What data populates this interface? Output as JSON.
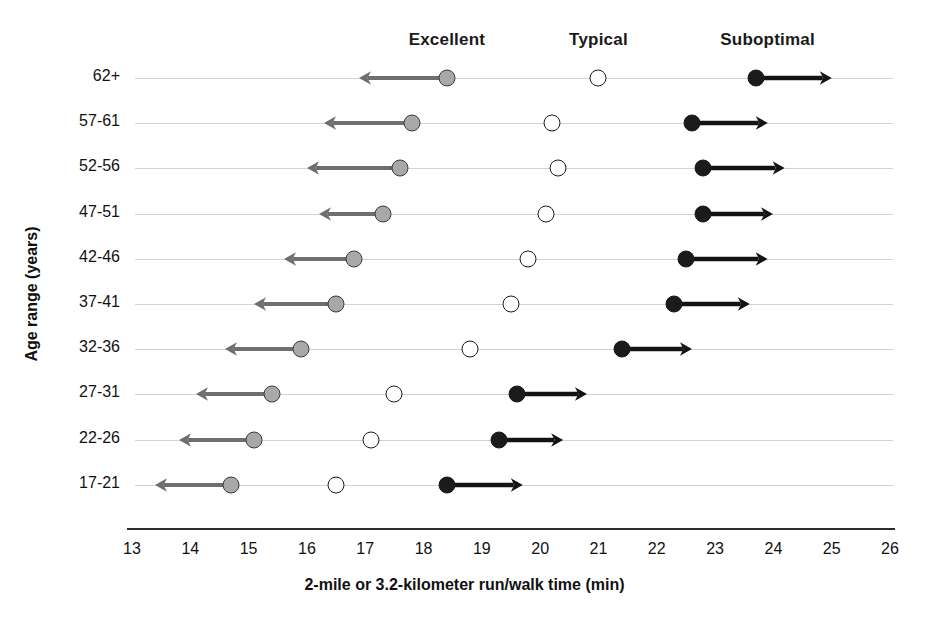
{
  "chart_data": {
    "type": "scatter",
    "title": "",
    "xlabel": "2-mile or 3.2-kilometer run/walk time (min)",
    "ylabel": "Age range (years)",
    "xlim": [
      13,
      26
    ],
    "xticks": [
      13,
      14,
      15,
      16,
      17,
      18,
      19,
      20,
      21,
      22,
      23,
      24,
      25,
      26
    ],
    "grid": true,
    "legend_position": "top",
    "zones": [
      {
        "key": "excellent",
        "label": "Excellent",
        "header_x": 18.4,
        "color": "#a8a8a8",
        "marker": "filled-gray-circle",
        "direction": "left"
      },
      {
        "key": "typical",
        "label": "Typical",
        "header_x": 21.0,
        "color": "#ffffff",
        "marker": "open-circle",
        "direction": "none"
      },
      {
        "key": "suboptimal",
        "label": "Suboptimal",
        "header_x": 23.9,
        "color": "#1b1b1b",
        "marker": "filled-black-circle",
        "direction": "right"
      }
    ],
    "categories": [
      "62+",
      "57-61",
      "52-56",
      "47-51",
      "42-46",
      "37-41",
      "32-36",
      "27-31",
      "22-26",
      "17-21"
    ],
    "rows": [
      {
        "category": "62+",
        "excellent": 18.4,
        "excellent_arrow_to": 16.9,
        "typical": 21.0,
        "suboptimal": 23.7,
        "suboptimal_arrow_to": 25.0
      },
      {
        "category": "57-61",
        "excellent": 17.8,
        "excellent_arrow_to": 16.3,
        "typical": 20.2,
        "suboptimal": 22.6,
        "suboptimal_arrow_to": 23.9
      },
      {
        "category": "52-56",
        "excellent": 17.6,
        "excellent_arrow_to": 16.0,
        "typical": 20.3,
        "suboptimal": 22.8,
        "suboptimal_arrow_to": 24.2
      },
      {
        "category": "47-51",
        "excellent": 17.3,
        "excellent_arrow_to": 16.2,
        "typical": 20.1,
        "suboptimal": 22.8,
        "suboptimal_arrow_to": 24.0
      },
      {
        "category": "42-46",
        "excellent": 16.8,
        "excellent_arrow_to": 15.6,
        "typical": 19.8,
        "suboptimal": 22.5,
        "suboptimal_arrow_to": 23.9
      },
      {
        "category": "37-41",
        "excellent": 16.5,
        "excellent_arrow_to": 15.1,
        "typical": 19.5,
        "suboptimal": 22.3,
        "suboptimal_arrow_to": 23.6
      },
      {
        "category": "32-36",
        "excellent": 15.9,
        "excellent_arrow_to": 14.6,
        "typical": 18.8,
        "suboptimal": 21.4,
        "suboptimal_arrow_to": 22.6
      },
      {
        "category": "27-31",
        "excellent": 15.4,
        "excellent_arrow_to": 14.1,
        "typical": 17.5,
        "suboptimal": 19.6,
        "suboptimal_arrow_to": 20.8
      },
      {
        "category": "22-26",
        "excellent": 15.1,
        "excellent_arrow_to": 13.8,
        "typical": 17.1,
        "suboptimal": 19.3,
        "suboptimal_arrow_to": 20.4
      },
      {
        "category": "17-21",
        "excellent": 14.7,
        "excellent_arrow_to": 13.4,
        "typical": 16.5,
        "suboptimal": 18.4,
        "suboptimal_arrow_to": 19.7
      }
    ]
  },
  "axis": {
    "x_title": "2-mile or 3.2-kilometer run/walk time (min)",
    "y_title": "Age range (years)",
    "x_tick_labels": [
      "13",
      "14",
      "15",
      "16",
      "17",
      "18",
      "19",
      "20",
      "21",
      "22",
      "23",
      "24",
      "25",
      "26"
    ]
  },
  "headers": {
    "excellent": "Excellent",
    "typical": "Typical",
    "suboptimal": "Suboptimal"
  }
}
